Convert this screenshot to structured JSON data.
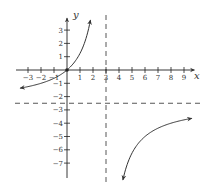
{
  "chart_data": {
    "type": "line",
    "title": "",
    "xlabel": "x",
    "ylabel": "y",
    "function": "f(x) = 2.5x / (3 - x)",
    "x_ticks": [
      -3,
      -2,
      -1,
      1,
      2,
      3,
      4,
      5,
      6,
      7,
      8,
      9
    ],
    "x_tick_labels": [
      "−3",
      "−2",
      "−1",
      "1",
      "2",
      "3",
      "4",
      "5",
      "6",
      "7",
      "8",
      "9"
    ],
    "y_ticks": [
      3,
      2,
      1,
      -1,
      -2,
      -3,
      -4,
      -5,
      -6,
      -7
    ],
    "y_tick_labels": [
      "3",
      "2",
      "1",
      "−1",
      "−2",
      "−3",
      "−4",
      "−5",
      "−6",
      "−7"
    ],
    "xlim": [
      -3.9,
      9.8
    ],
    "ylim": [
      -8.5,
      3.9
    ],
    "grid": false,
    "asymptotes": {
      "vertical": {
        "x": 3,
        "style": "dashed"
      },
      "horizontal": {
        "y": -2.5,
        "style": "dashed"
      }
    },
    "points": [
      {
        "x": 0,
        "y": 0,
        "marker": "dot"
      }
    ],
    "series": [
      {
        "name": "left branch",
        "x": [
          -3.6,
          -3,
          -2,
          -1,
          0,
          0.5,
          1,
          1.5,
          1.8
        ],
        "y": [
          -1.36,
          -1.25,
          -1.0,
          -0.63,
          0,
          0.5,
          1.25,
          2.5,
          3.75
        ],
        "arrows": "both ends"
      },
      {
        "name": "right branch",
        "x": [
          4.3,
          5,
          6,
          7,
          8,
          9,
          9.6
        ],
        "y": [
          -8.27,
          -6.25,
          -5.0,
          -4.38,
          -4.0,
          -3.75,
          -3.64
        ],
        "arrows": "both ends"
      }
    ],
    "colors": {
      "curve": "#333333",
      "axis": "#222222",
      "asymptote": "#444444"
    }
  }
}
